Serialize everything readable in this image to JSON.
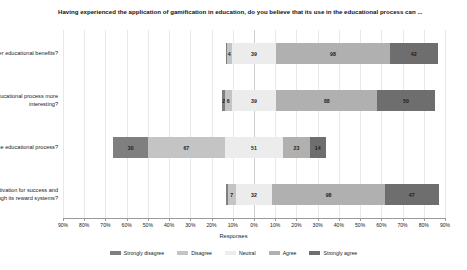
{
  "chart_data": {
    "type": "bar",
    "subtype": "diverging-stacked-likert",
    "title": "Having experienced the application of gamification in education, do you believe that its use in the educational process can ...",
    "xlabel": "Responses",
    "ylabel": "",
    "grid": true,
    "legend_position": "bottom",
    "xlim": [
      -90,
      90
    ],
    "xtick_labels": [
      "90%",
      "80%",
      "70%",
      "60%",
      "50%",
      "40%",
      "30%",
      "20%",
      "10%",
      "0%",
      "10%",
      "20%",
      "30%",
      "40%",
      "50%",
      "60%",
      "70%",
      "80%",
      "90%"
    ],
    "xtick_values": [
      -90,
      -80,
      -70,
      -60,
      -50,
      -40,
      -30,
      -20,
      -10,
      0,
      10,
      20,
      30,
      40,
      50,
      60,
      70,
      80,
      90
    ],
    "legend": [
      "Strongly disagree",
      "Disagree",
      "Neutral",
      "Agree",
      "Strongly agree"
    ],
    "colors": {
      "strongly_disagree": "#7f7f7f",
      "disagree": "#c4c4c4",
      "neutral": "#ececec",
      "agree": "#b0b0b0",
      "strongly_agree": "#6e6e6e"
    },
    "categories": [
      "... offer educational benefits?",
      "... render the educational process more interesting?",
      "... hinder the educational process?",
      "... promote learning motivation for success and intense effort through its reward systems?"
    ],
    "series": [
      {
        "name": "Strongly disagree",
        "values": [
          1,
          2,
          30,
          1
        ]
      },
      {
        "name": "Disagree",
        "values": [
          4,
          6,
          67,
          7
        ]
      },
      {
        "name": "Neutral",
        "values": [
          39,
          39,
          51,
          32
        ]
      },
      {
        "name": "Agree",
        "values": [
          98,
          88,
          23,
          98
        ]
      },
      {
        "name": "Strongly agree",
        "values": [
          42,
          50,
          14,
          47
        ]
      }
    ],
    "bars": [
      {
        "category": "... offer educational benefits?",
        "segments": [
          {
            "key": "strongly_disagree",
            "label": "1",
            "value": 1,
            "show_label": false
          },
          {
            "key": "disagree",
            "label": "4",
            "value": 4,
            "show_label": true
          },
          {
            "key": "neutral",
            "label": "39",
            "value": 39,
            "show_label": true
          },
          {
            "key": "agree",
            "label": "98",
            "value": 98,
            "show_label": true
          },
          {
            "key": "strongly_agree",
            "label": "42",
            "value": 42,
            "show_label": true
          }
        ]
      },
      {
        "category": "... render the educational process more interesting?",
        "segments": [
          {
            "key": "strongly_disagree",
            "label": "2",
            "value": 2,
            "show_label": true
          },
          {
            "key": "disagree",
            "label": "6",
            "value": 6,
            "show_label": true
          },
          {
            "key": "neutral",
            "label": "39",
            "value": 39,
            "show_label": true
          },
          {
            "key": "agree",
            "label": "88",
            "value": 88,
            "show_label": true
          },
          {
            "key": "strongly_agree",
            "label": "50",
            "value": 50,
            "show_label": true
          }
        ]
      },
      {
        "category": "... hinder the educational process?",
        "segments": [
          {
            "key": "strongly_disagree",
            "label": "30",
            "value": 30,
            "show_label": true
          },
          {
            "key": "disagree",
            "label": "67",
            "value": 67,
            "show_label": true
          },
          {
            "key": "neutral",
            "label": "51",
            "value": 51,
            "show_label": true
          },
          {
            "key": "agree",
            "label": "23",
            "value": 23,
            "show_label": true
          },
          {
            "key": "strongly_agree",
            "label": "14",
            "value": 14,
            "show_label": true
          }
        ]
      },
      {
        "category": "... promote learning motivation for success and intense effort through its reward systems?",
        "segments": [
          {
            "key": "strongly_disagree",
            "label": "1",
            "value": 1,
            "show_label": false
          },
          {
            "key": "disagree",
            "label": "7",
            "value": 7,
            "show_label": true
          },
          {
            "key": "neutral",
            "label": "32",
            "value": 32,
            "show_label": true
          },
          {
            "key": "agree",
            "label": "98",
            "value": 98,
            "show_label": true
          },
          {
            "key": "strongly_agree",
            "label": "47",
            "value": 47,
            "show_label": true
          }
        ]
      }
    ]
  }
}
